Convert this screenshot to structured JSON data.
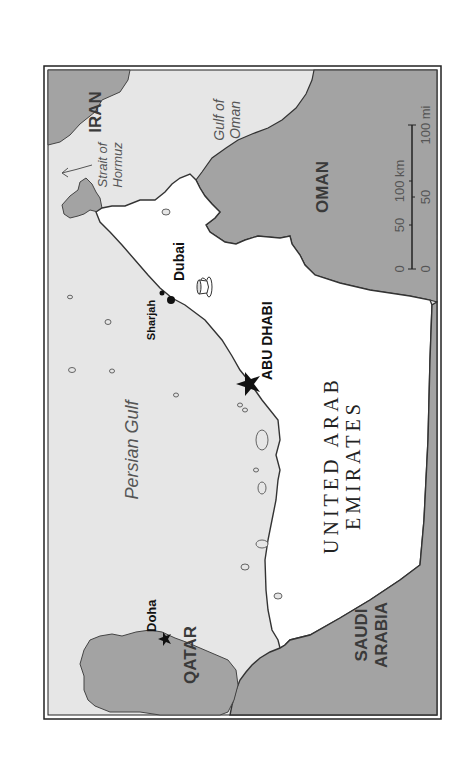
{
  "map": {
    "orientation": "rotated 90deg counter-clockwise",
    "countries": [
      {
        "id": "iran",
        "label": "IRAN"
      },
      {
        "id": "oman",
        "label": "OMAN"
      },
      {
        "id": "uae",
        "label_line1": "UNITED ARAB",
        "label_line2": "EMIRATES"
      },
      {
        "id": "qatar",
        "label": "QATAR"
      },
      {
        "id": "saudi",
        "label_line1": "SAUDI",
        "label_line2": "ARABIA"
      }
    ],
    "water_bodies": [
      {
        "id": "persian-gulf",
        "label": "Persian Gulf"
      },
      {
        "id": "gulf-of-oman",
        "label_line1": "Gulf of",
        "label_line2": "Oman"
      },
      {
        "id": "strait-of-hormuz",
        "label_line1": "Strait of",
        "label_line2": "Hormuz"
      }
    ],
    "cities": [
      {
        "id": "dubai",
        "label": "Dubai",
        "type": "city"
      },
      {
        "id": "sharjah",
        "label": "Sharjah",
        "type": "city"
      },
      {
        "id": "abu-dhabi",
        "label": "ABU DHABI",
        "type": "capital"
      },
      {
        "id": "doha",
        "label": "Doha",
        "type": "capital"
      }
    ],
    "scale": {
      "km_labels": [
        "0",
        "50",
        "100 km"
      ],
      "mi_labels": [
        "0",
        "50",
        "100 mi"
      ]
    },
    "colors": {
      "water": "#e6e6e6",
      "neighbor_land": "#a3a3a3",
      "uae_land": "#ffffff",
      "border": "#333333",
      "frame": "#222222"
    }
  }
}
